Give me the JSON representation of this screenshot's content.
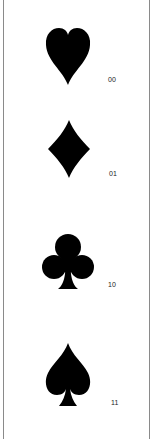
{
  "suits": [
    {
      "name": "heart",
      "code": "00"
    },
    {
      "name": "diamond",
      "code": "01"
    },
    {
      "name": "club",
      "code": "10"
    },
    {
      "name": "spade",
      "code": "11"
    }
  ],
  "colors": {
    "fill": "#000000",
    "border": "#8a8a8a"
  }
}
